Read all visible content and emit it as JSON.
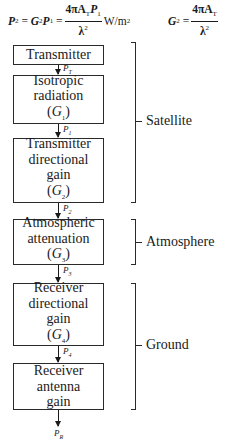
{
  "formulas": {
    "power_density": {
      "lhs": "P",
      "lhs_sub": "2",
      "mid": "G",
      "mid_sub": "2",
      "mid_var": "P",
      "mid_var_sub": "1",
      "numerator": "4πA",
      "numerator_sub": "T",
      "numerator_tail": "P",
      "numerator_tail_sub": "1",
      "denominator": "λ",
      "denominator_sup": "2",
      "unit": "W/m",
      "unit_sup": "2"
    },
    "gain": {
      "lhs": "G",
      "lhs_sub": "2",
      "numerator": "4πA",
      "numerator_sub": "T",
      "denominator": "λ",
      "denominator_sup": "2"
    }
  },
  "blocks": [
    {
      "lines": [
        "Transmitter"
      ],
      "gain_symbol": null
    },
    {
      "lines": [
        "Isotropic",
        "radiation"
      ],
      "gain_symbol": "G",
      "gain_sub": "1"
    },
    {
      "lines": [
        "Transmitter",
        "directional",
        "gain"
      ],
      "gain_symbol": "G",
      "gain_sub": "2"
    },
    {
      "lines": [
        "Atmospheric",
        "attenuation"
      ],
      "gain_symbol": "G",
      "gain_sub": "3"
    },
    {
      "lines": [
        "Receiver",
        "directional",
        "gain"
      ],
      "gain_symbol": "G",
      "gain_sub": "4"
    },
    {
      "lines": [
        "Receiver",
        "antenna",
        "gain"
      ],
      "gain_symbol": null
    }
  ],
  "signals": [
    {
      "base": "P",
      "sub": "T"
    },
    {
      "base": "P",
      "sub": "1"
    },
    {
      "base": "P",
      "sub": "2"
    },
    {
      "base": "P",
      "sub": "3"
    },
    {
      "base": "P",
      "sub": "4"
    },
    {
      "base": "P",
      "sub": "R"
    }
  ],
  "groups": [
    {
      "label": "Satellite"
    },
    {
      "label": "Atmosphere"
    },
    {
      "label": "Ground"
    }
  ]
}
